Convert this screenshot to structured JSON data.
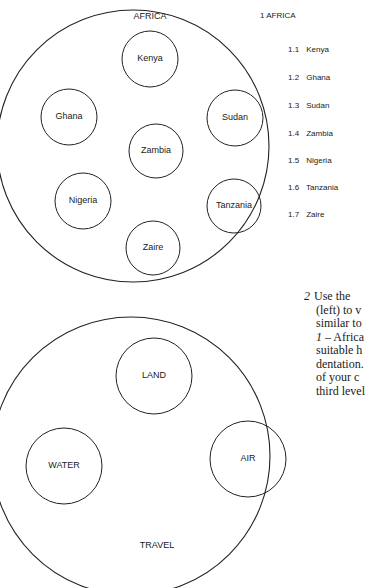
{
  "africa_diagram": {
    "title": "AFRICA",
    "circles": [
      {
        "label": "Kenya",
        "cx": 150,
        "cy": 59,
        "r": 28
      },
      {
        "label": "Ghana",
        "cx": 69,
        "cy": 117,
        "r": 28
      },
      {
        "label": "Sudan",
        "cx": 235,
        "cy": 118,
        "r": 28
      },
      {
        "label": "Zambia",
        "cx": 156,
        "cy": 151,
        "r": 27
      },
      {
        "label": "Nigeria",
        "cx": 83,
        "cy": 201,
        "r": 28
      },
      {
        "label": "Tanzania",
        "cx": 234,
        "cy": 206,
        "r": 27
      },
      {
        "label": "Zaire",
        "cx": 153,
        "cy": 248,
        "r": 27
      }
    ]
  },
  "africa_outline": {
    "heading": "1 AFRICA",
    "items": [
      {
        "num": "1.1",
        "label": "Kenya"
      },
      {
        "num": "1.2",
        "label": "Ghana"
      },
      {
        "num": "1.3",
        "label": "Sudan"
      },
      {
        "num": "1.4",
        "label": "Zambia"
      },
      {
        "num": "1.5",
        "label": "Nigeria"
      },
      {
        "num": "1.6",
        "label": "Tanzania"
      },
      {
        "num": "1.7",
        "label": "Zaire"
      }
    ]
  },
  "travel_diagram": {
    "title": "TRAVEL",
    "circles": [
      {
        "label": "LAND",
        "cx": 154,
        "cy": 376,
        "r": 38
      },
      {
        "label": "WATER",
        "cx": 64,
        "cy": 466,
        "r": 38
      },
      {
        "label": "AIR",
        "cx": 248,
        "cy": 459,
        "r": 38
      }
    ]
  },
  "instruction": {
    "number": "2",
    "lines": [
      "Use the",
      "(left) to v",
      "similar to",
      "1 – Africa",
      "suitable h",
      "dentation.",
      "of your c",
      "third level"
    ]
  }
}
